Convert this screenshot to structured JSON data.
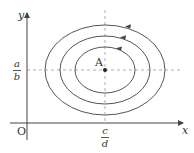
{
  "diagram": {
    "axes": {
      "x_label": "x",
      "y_label": "y",
      "origin_label": "O"
    },
    "center_point": {
      "label": "A",
      "x_fraction": {
        "numerator": "c",
        "denominator": "d"
      },
      "y_fraction": {
        "numerator": "a",
        "denominator": "b"
      }
    },
    "orbits": [
      {
        "name": "inner",
        "direction": "counterclockwise"
      },
      {
        "name": "middle",
        "direction": "counterclockwise"
      },
      {
        "name": "outer",
        "direction": "counterclockwise"
      }
    ],
    "colors": {
      "stroke": "#555555",
      "dashed": "#999999",
      "point": "#222222"
    }
  }
}
